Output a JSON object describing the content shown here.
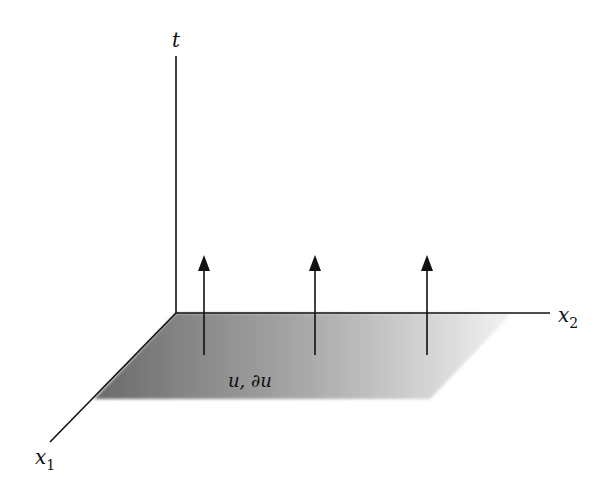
{
  "diagram": {
    "axes": {
      "t": {
        "label": "t"
      },
      "x1": {
        "label": "x",
        "subscript": "1"
      },
      "x2": {
        "label": "x",
        "subscript": "2"
      }
    },
    "plane": {
      "label": "u, ∂u",
      "gradient_start": "#6e6e6e",
      "gradient_end": "#f0f0f0"
    },
    "arrows": [
      {
        "x": 204
      },
      {
        "x": 315
      },
      {
        "x": 427
      }
    ],
    "colors": {
      "line": "#111111",
      "background": "#ffffff"
    }
  }
}
